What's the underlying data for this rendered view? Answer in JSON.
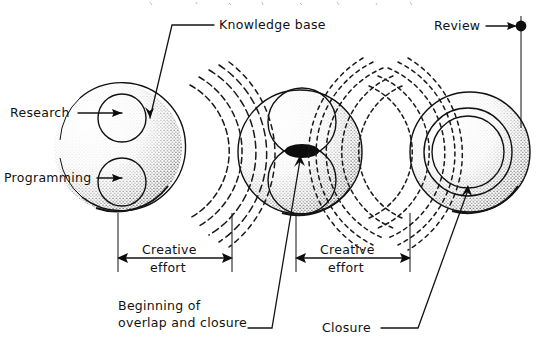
{
  "diagram": {
    "medium": "hand-drawn ink sketch on white paper",
    "background_color": "#ffffff",
    "ink_color": "#111111"
  },
  "labels": {
    "knowledge_base": "Knowledge base",
    "review": "Review",
    "research": "Research",
    "programming": "Programming",
    "creative_effort_1": "Creative",
    "creative_effort_1b": "effort",
    "creative_effort_2": "Creative",
    "creative_effort_2b": "effort",
    "beginning_line1": "Beginning of",
    "beginning_line2": "overlap and closure",
    "closure": "Closure"
  },
  "stages": [
    {
      "name": "stage-1-separate-spheres",
      "description": "Stippled sphere containing two small separate circles fed by Research and Programming arrows",
      "inner_circle_count": 2,
      "inner_circles_overlap": false,
      "shading": "stipple"
    },
    {
      "name": "stage-2-overlapping-spheres",
      "description": "Stippled sphere containing two large circles that touch and overlap at a dark lens in the centre",
      "inner_circle_count": 2,
      "inner_circles_overlap": true,
      "shading": "stipple"
    },
    {
      "name": "stage-3-closure",
      "description": "Stippled sphere containing a ring and an inner circle filled with vertical hatching, representing closure",
      "inner_circle_count": 2,
      "inner_circles_overlap": false,
      "shading": "stipple + vertical hatch fill"
    }
  ],
  "wave_groups": [
    {
      "name": "wave-group-1",
      "between": [
        "stage-1-separate-spheres",
        "stage-2-overlapping-spheres"
      ],
      "arc_count": 5,
      "style": "concentric dashed arcs radiating right"
    },
    {
      "name": "wave-group-2",
      "between": [
        "stage-2-overlapping-spheres",
        "stage-3-closure"
      ],
      "arc_count": 10,
      "style": "two interfering sets of dashed arcs crossing each other"
    }
  ],
  "measures": [
    {
      "name": "creative-effort-1",
      "label": "Creative effort",
      "kind": "double-headed dimension arrow"
    },
    {
      "name": "creative-effort-2",
      "label": "Creative effort",
      "kind": "double-headed dimension arrow"
    }
  ],
  "callouts": [
    {
      "name": "knowledge-base-callout",
      "label": "Knowledge base",
      "points_to": "stage-1-separate-spheres"
    },
    {
      "name": "beginning-overlap-callout",
      "label": "Beginning of overlap and closure",
      "points_to": "stage-2-overlapping-spheres"
    },
    {
      "name": "closure-callout",
      "label": "Closure",
      "points_to": "stage-3-closure"
    },
    {
      "name": "review-callout",
      "label": "Review",
      "points_to": "review-milestone-dot"
    }
  ],
  "inputs": [
    {
      "name": "research-input",
      "label": "Research",
      "target": "stage-1-upper-circle"
    },
    {
      "name": "programming-input",
      "label": "Programming",
      "target": "stage-1-lower-circle"
    }
  ],
  "milestone": {
    "name": "review-milestone-dot",
    "shape": "filled dot with vertical drop line",
    "color": "#0d0d0d"
  }
}
